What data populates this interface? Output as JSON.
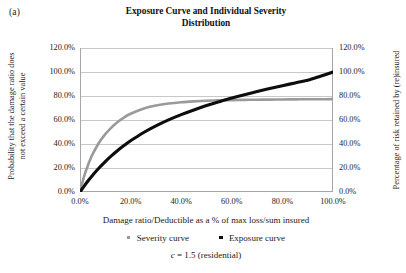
{
  "panel_label": "(a)",
  "title": {
    "line1": "Exposure Curve and Individual Severity",
    "line2": "Distribution"
  },
  "axis_titles": {
    "y_left_line1": "Probability that the damage ratio does",
    "y_left_line2": "not exceed a certain value",
    "y_right": "Percentage of risk retained by (re)insured",
    "x": "Damage ratio/Deductible as a % of max loss/sum insured"
  },
  "legend": {
    "items": [
      {
        "label": "Severity curve",
        "color": "#9a9a9a"
      },
      {
        "label": "Exposure curve",
        "color": "#0d0d0d"
      }
    ]
  },
  "caption": {
    "symbol": "c",
    "text": " = 1.5 (residential)"
  },
  "colors": {
    "severity": "#9a9a9a",
    "exposure": "#0d0d0d",
    "grid": "#c8c8c8",
    "axis": "#a6a6a6",
    "background": "#ffffff"
  },
  "chart_data": {
    "type": "line",
    "title": "Exposure Curve and Individual Severity Distribution",
    "subtitle": "c = 1.5 (residential)",
    "xlabel": "Damage ratio/Deductible as a % of max loss/sum insured",
    "ylabel": "Probability that the damage ratio does not exceed a certain value",
    "ylabel_secondary": "Percentage of risk retained by (re)insured",
    "xlim": [
      0,
      100
    ],
    "ylim": [
      0,
      120
    ],
    "ylim_secondary": [
      0,
      120
    ],
    "xticks": [
      0,
      20,
      40,
      60,
      80,
      100
    ],
    "xticklabels": [
      "0.0%",
      "20.0%",
      "40.0%",
      "60.0%",
      "80.0%",
      "100.0%"
    ],
    "yticks": [
      0,
      20,
      40,
      60,
      80,
      100,
      120
    ],
    "yticklabels": [
      "0.0%",
      "20.0%",
      "40.0%",
      "60.0%",
      "80.0%",
      "100.0%",
      "120.0%"
    ],
    "yticks_secondary": [
      0,
      20,
      40,
      60,
      80,
      100,
      120
    ],
    "yticklabels_secondary": [
      "0.0%",
      "20.0%",
      "40.0%",
      "60.0%",
      "80.0%",
      "100.0%",
      "120.0%"
    ],
    "grid": true,
    "grid_axis": "y",
    "legend_position": "below",
    "x": [
      0,
      1,
      2,
      3,
      4,
      5,
      7.5,
      10,
      12.5,
      15,
      17.5,
      20,
      25,
      30,
      35,
      40,
      45,
      50,
      55,
      60,
      65,
      70,
      75,
      80,
      85,
      90,
      95,
      100
    ],
    "series": [
      {
        "name": "Severity curve",
        "axis": "left",
        "color": "#9a9a9a",
        "values": [
          0,
          8.5,
          15.5,
          21.5,
          26.8,
          31.5,
          41.0,
          48.2,
          53.9,
          58.5,
          62.2,
          65.2,
          69.4,
          72.0,
          73.7,
          74.8,
          75.5,
          76.0,
          76.4,
          76.6,
          76.8,
          76.9,
          77.0,
          77.1,
          77.2,
          77.3,
          77.3,
          77.4
        ]
      },
      {
        "name": "Exposure curve",
        "axis": "right",
        "color": "#0d0d0d",
        "values": [
          0,
          3.0,
          5.9,
          8.7,
          11.4,
          14.0,
          20.0,
          25.4,
          30.3,
          34.8,
          38.9,
          42.7,
          49.4,
          55.1,
          60.1,
          64.5,
          68.4,
          72.0,
          75.2,
          78.3,
          81.1,
          83.7,
          86.2,
          88.6,
          90.9,
          93.2,
          96.5,
          100.0
        ]
      }
    ]
  }
}
